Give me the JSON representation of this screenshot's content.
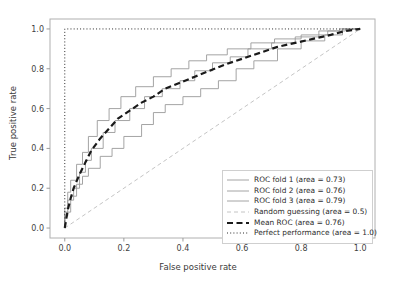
{
  "chart_data": {
    "type": "line",
    "title": "",
    "xlabel": "False positive rate",
    "ylabel": "True positive rate",
    "xlim": [
      -0.05,
      1.05
    ],
    "ylim": [
      -0.05,
      1.05
    ],
    "xticks": [
      "0.0",
      "0.2",
      "0.4",
      "0.6",
      "0.8",
      "1.0"
    ],
    "xtick_values": [
      0.0,
      0.2,
      0.4,
      0.6,
      0.8,
      1.0
    ],
    "yticks": [
      "0.0",
      "0.2",
      "0.4",
      "0.6",
      "0.8",
      "1.0"
    ],
    "ytick_values": [
      0.0,
      0.2,
      0.4,
      0.6,
      0.8,
      1.0
    ],
    "grid": false,
    "legend_position": "lower right",
    "series": [
      {
        "name": "ROC fold 1 (area = 0.73)",
        "area": 0.73,
        "style": "solid",
        "color": "#9a9a9a",
        "width": 0.9,
        "x": [
          0.0,
          0.0,
          0.02,
          0.02,
          0.04,
          0.04,
          0.06,
          0.06,
          0.08,
          0.08,
          0.12,
          0.12,
          0.16,
          0.16,
          0.2,
          0.2,
          0.26,
          0.26,
          0.3,
          0.3,
          0.34,
          0.34,
          0.4,
          0.4,
          0.46,
          0.46,
          0.52,
          0.52,
          0.58,
          0.58,
          0.64,
          0.64,
          0.72,
          0.72,
          0.8,
          0.8,
          0.88,
          0.88,
          0.94,
          0.94,
          1.0
        ],
        "y": [
          0.0,
          0.08,
          0.08,
          0.16,
          0.16,
          0.22,
          0.22,
          0.26,
          0.26,
          0.3,
          0.3,
          0.36,
          0.36,
          0.4,
          0.4,
          0.46,
          0.46,
          0.52,
          0.52,
          0.58,
          0.58,
          0.62,
          0.62,
          0.66,
          0.66,
          0.7,
          0.7,
          0.74,
          0.74,
          0.8,
          0.8,
          0.84,
          0.84,
          0.9,
          0.9,
          0.94,
          0.94,
          0.97,
          0.97,
          1.0,
          1.0
        ]
      },
      {
        "name": "ROC fold 2 (area = 0.76)",
        "area": 0.76,
        "style": "solid",
        "color": "#9a9a9a",
        "width": 0.9,
        "x": [
          0.0,
          0.0,
          0.01,
          0.01,
          0.03,
          0.03,
          0.05,
          0.05,
          0.07,
          0.07,
          0.09,
          0.09,
          0.13,
          0.13,
          0.17,
          0.17,
          0.22,
          0.22,
          0.27,
          0.27,
          0.33,
          0.33,
          0.39,
          0.39,
          0.44,
          0.44,
          0.5,
          0.5,
          0.56,
          0.56,
          0.62,
          0.62,
          0.7,
          0.7,
          0.78,
          0.78,
          0.86,
          0.86,
          0.93,
          0.93,
          1.0
        ],
        "y": [
          0.0,
          0.06,
          0.06,
          0.14,
          0.14,
          0.2,
          0.2,
          0.28,
          0.28,
          0.34,
          0.34,
          0.4,
          0.4,
          0.48,
          0.48,
          0.54,
          0.54,
          0.6,
          0.6,
          0.66,
          0.66,
          0.7,
          0.7,
          0.74,
          0.74,
          0.79,
          0.79,
          0.83,
          0.83,
          0.86,
          0.86,
          0.9,
          0.9,
          0.93,
          0.93,
          0.96,
          0.96,
          0.99,
          0.99,
          1.0,
          1.0
        ]
      },
      {
        "name": "ROC fold 3 (area = 0.79)",
        "area": 0.79,
        "style": "solid",
        "color": "#9a9a9a",
        "width": 0.9,
        "x": [
          0.0,
          0.0,
          0.01,
          0.01,
          0.02,
          0.02,
          0.04,
          0.04,
          0.06,
          0.06,
          0.08,
          0.08,
          0.11,
          0.11,
          0.15,
          0.15,
          0.19,
          0.19,
          0.24,
          0.24,
          0.3,
          0.3,
          0.36,
          0.36,
          0.42,
          0.42,
          0.48,
          0.48,
          0.55,
          0.55,
          0.63,
          0.63,
          0.71,
          0.71,
          0.8,
          0.8,
          0.89,
          0.89,
          0.95,
          0.95,
          1.0
        ],
        "y": [
          0.0,
          0.1,
          0.1,
          0.18,
          0.18,
          0.24,
          0.24,
          0.32,
          0.32,
          0.38,
          0.38,
          0.46,
          0.46,
          0.54,
          0.54,
          0.6,
          0.6,
          0.66,
          0.66,
          0.71,
          0.71,
          0.76,
          0.76,
          0.8,
          0.8,
          0.84,
          0.84,
          0.87,
          0.87,
          0.9,
          0.9,
          0.93,
          0.93,
          0.95,
          0.95,
          0.97,
          0.97,
          0.99,
          0.99,
          1.0,
          1.0
        ]
      },
      {
        "name": "Random guessing (area = 0.5)",
        "area": 0.5,
        "style": "dashed",
        "color": "#bdbdbd",
        "width": 0.9,
        "x": [
          0.0,
          1.0
        ],
        "y": [
          0.0,
          1.0
        ]
      },
      {
        "name": "Mean ROC (area = 0.76)",
        "area": 0.76,
        "style": "dashed",
        "color": "#1a1a1a",
        "width": 2.2,
        "x": [
          0.0,
          0.01,
          0.02,
          0.03,
          0.05,
          0.07,
          0.09,
          0.12,
          0.15,
          0.18,
          0.22,
          0.26,
          0.3,
          0.34,
          0.39,
          0.44,
          0.49,
          0.54,
          0.6,
          0.66,
          0.72,
          0.78,
          0.84,
          0.9,
          0.95,
          1.0
        ],
        "y": [
          0.0,
          0.09,
          0.15,
          0.2,
          0.27,
          0.33,
          0.39,
          0.45,
          0.5,
          0.55,
          0.59,
          0.63,
          0.66,
          0.7,
          0.73,
          0.76,
          0.79,
          0.82,
          0.85,
          0.88,
          0.91,
          0.93,
          0.95,
          0.97,
          0.99,
          1.0
        ]
      },
      {
        "name": "Perfect performance (area = 1.0)",
        "area": 1.0,
        "style": "dotted",
        "color": "#2a2a2a",
        "width": 1.0,
        "x": [
          0.0,
          0.0,
          1.0
        ],
        "y": [
          0.0,
          1.0,
          1.0
        ]
      }
    ]
  }
}
